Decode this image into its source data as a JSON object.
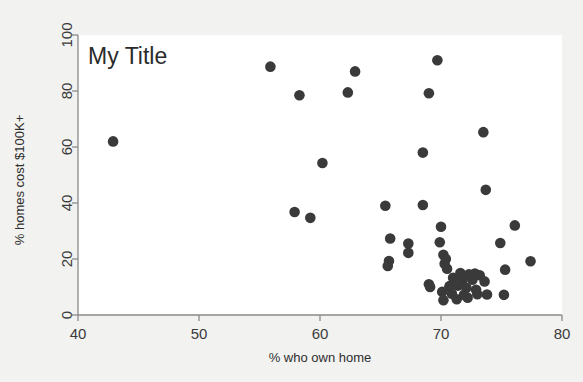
{
  "chart_data": {
    "type": "scatter",
    "title": "My Title",
    "xlabel": "% who own home",
    "ylabel": "% homes cost $100K+",
    "xlim": [
      40,
      80
    ],
    "ylim": [
      0,
      100
    ],
    "xticks": [
      40,
      50,
      60,
      70,
      80
    ],
    "yticks": [
      0,
      20,
      40,
      60,
      80,
      100
    ],
    "xtick_labels": [
      "40",
      "50",
      "60",
      "70",
      "80"
    ],
    "ytick_labels": [
      "0",
      "20",
      "40",
      "60",
      "80",
      "100"
    ],
    "grid": false,
    "legend": null,
    "marker": {
      "shape": "circle",
      "color": "#3a3a3a",
      "size": 9
    },
    "background_color": "#f2f2f0",
    "plot_background_color": "#ffffff",
    "axis_color": "#8a8a8a",
    "points": [
      {
        "x": 42.9,
        "y": 62.0
      },
      {
        "x": 55.9,
        "y": 88.7
      },
      {
        "x": 58.3,
        "y": 78.5
      },
      {
        "x": 62.3,
        "y": 79.5
      },
      {
        "x": 62.9,
        "y": 87.0
      },
      {
        "x": 69.7,
        "y": 91.0
      },
      {
        "x": 69.0,
        "y": 79.2
      },
      {
        "x": 73.5,
        "y": 65.3
      },
      {
        "x": 68.5,
        "y": 58.0
      },
      {
        "x": 60.2,
        "y": 54.3
      },
      {
        "x": 73.7,
        "y": 44.7
      },
      {
        "x": 65.4,
        "y": 39.0
      },
      {
        "x": 68.5,
        "y": 39.3
      },
      {
        "x": 57.9,
        "y": 36.8
      },
      {
        "x": 59.2,
        "y": 34.7
      },
      {
        "x": 76.1,
        "y": 32.0
      },
      {
        "x": 70.0,
        "y": 31.5
      },
      {
        "x": 65.8,
        "y": 27.3
      },
      {
        "x": 69.9,
        "y": 26.0
      },
      {
        "x": 67.3,
        "y": 25.5
      },
      {
        "x": 74.9,
        "y": 25.7
      },
      {
        "x": 67.3,
        "y": 22.2
      },
      {
        "x": 70.2,
        "y": 21.5
      },
      {
        "x": 70.4,
        "y": 20.0
      },
      {
        "x": 65.7,
        "y": 19.3
      },
      {
        "x": 65.6,
        "y": 17.5
      },
      {
        "x": 77.4,
        "y": 19.2
      },
      {
        "x": 70.3,
        "y": 18.3
      },
      {
        "x": 70.5,
        "y": 16.5
      },
      {
        "x": 75.3,
        "y": 16.2
      },
      {
        "x": 71.6,
        "y": 15.0
      },
      {
        "x": 72.3,
        "y": 14.5
      },
      {
        "x": 72.8,
        "y": 14.8
      },
      {
        "x": 73.2,
        "y": 14.2
      },
      {
        "x": 71.0,
        "y": 13.3
      },
      {
        "x": 71.8,
        "y": 12.7
      },
      {
        "x": 72.6,
        "y": 12.6
      },
      {
        "x": 73.6,
        "y": 12.0
      },
      {
        "x": 69.0,
        "y": 11.0
      },
      {
        "x": 69.1,
        "y": 10.0
      },
      {
        "x": 70.7,
        "y": 10.3
      },
      {
        "x": 71.4,
        "y": 10.5
      },
      {
        "x": 72.1,
        "y": 9.7
      },
      {
        "x": 72.9,
        "y": 9.0
      },
      {
        "x": 70.1,
        "y": 8.3
      },
      {
        "x": 70.9,
        "y": 7.6
      },
      {
        "x": 71.9,
        "y": 7.2
      },
      {
        "x": 73.0,
        "y": 7.4
      },
      {
        "x": 73.8,
        "y": 7.3
      },
      {
        "x": 75.2,
        "y": 7.2
      },
      {
        "x": 70.2,
        "y": 5.3
      },
      {
        "x": 71.3,
        "y": 5.6
      },
      {
        "x": 72.2,
        "y": 6.2
      }
    ]
  }
}
